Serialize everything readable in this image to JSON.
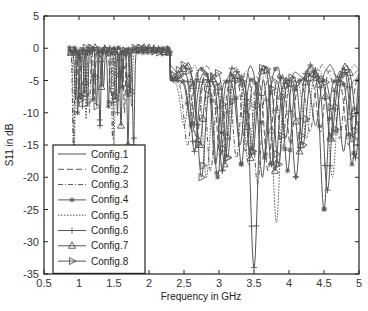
{
  "chart_data": {
    "type": "line",
    "title": "",
    "xlabel": "Frequency in GHz",
    "ylabel": "S11 in dB",
    "xlim": [
      0.5,
      5
    ],
    "ylim": [
      -35,
      5
    ],
    "xticks": [
      0.5,
      1,
      1.5,
      2,
      2.5,
      3,
      3.5,
      4,
      4.5,
      5
    ],
    "xtick_labels": [
      "0.5",
      "1",
      "1.5",
      "2",
      "2.5",
      "3",
      "3.5",
      "4",
      "4.5",
      "5"
    ],
    "yticks": [
      5,
      0,
      -5,
      -10,
      -15,
      -20,
      -25,
      -30,
      -35
    ],
    "ytick_labels": [
      "5",
      "0",
      "-5",
      "-10",
      "-15",
      "-20",
      "-25",
      "-30",
      "-35"
    ],
    "grid": false,
    "legend_position": "bottom-left",
    "line_color": "#555555",
    "series": [
      {
        "name": "Config.1",
        "style": "solid",
        "marker": "none",
        "dips": [
          [
            0.95,
            -8
          ],
          [
            1.12,
            -9
          ],
          [
            1.35,
            -6
          ],
          [
            1.58,
            -7
          ],
          [
            2.62,
            -13
          ],
          [
            2.95,
            -18
          ],
          [
            3.3,
            -15
          ],
          [
            3.62,
            -20
          ],
          [
            3.95,
            -14
          ],
          [
            4.38,
            -12
          ],
          [
            4.78,
            -16
          ]
        ]
      },
      {
        "name": "Config.2",
        "style": "dashed",
        "marker": "none",
        "dips": [
          [
            1.0,
            -9
          ],
          [
            1.22,
            -8
          ],
          [
            1.45,
            -7
          ],
          [
            1.65,
            -10
          ],
          [
            2.68,
            -14
          ],
          [
            3.02,
            -17
          ],
          [
            3.38,
            -16
          ],
          [
            3.7,
            -19
          ],
          [
            4.02,
            -15
          ],
          [
            4.45,
            -13
          ],
          [
            4.85,
            -15
          ]
        ]
      },
      {
        "name": "Config.3",
        "style": "dashdot",
        "marker": "none",
        "dips": [
          [
            0.92,
            -16
          ],
          [
            1.15,
            -10
          ],
          [
            1.48,
            -14
          ],
          [
            1.7,
            -8
          ],
          [
            2.55,
            -15
          ],
          [
            2.88,
            -19
          ],
          [
            3.25,
            -17
          ],
          [
            3.55,
            -21
          ],
          [
            3.9,
            -16
          ],
          [
            4.3,
            -13
          ],
          [
            4.72,
            -14
          ]
        ]
      },
      {
        "name": "Config.4",
        "style": "solid",
        "marker": "star",
        "dips": [
          [
            0.98,
            -10
          ],
          [
            1.2,
            -8
          ],
          [
            1.42,
            -9
          ],
          [
            1.62,
            -6
          ],
          [
            2.6,
            -12
          ],
          [
            2.98,
            -20
          ],
          [
            3.32,
            -18
          ],
          [
            3.65,
            -17
          ],
          [
            3.98,
            -19
          ],
          [
            4.5,
            -25
          ],
          [
            4.9,
            -18
          ]
        ]
      },
      {
        "name": "Config.5",
        "style": "dotted",
        "marker": "none",
        "dips": [
          [
            0.93,
            -17
          ],
          [
            1.1,
            -11
          ],
          [
            1.5,
            -15
          ],
          [
            1.75,
            -9
          ],
          [
            2.5,
            -12
          ],
          [
            2.82,
            -20
          ],
          [
            3.1,
            -16
          ],
          [
            3.42,
            -18
          ],
          [
            3.82,
            -27
          ],
          [
            4.25,
            -14
          ],
          [
            4.62,
            -20
          ]
        ]
      },
      {
        "name": "Config.6",
        "style": "solid",
        "marker": "plus",
        "dips": [
          [
            1.05,
            -9
          ],
          [
            1.3,
            -12
          ],
          [
            1.55,
            -10
          ],
          [
            1.78,
            -15
          ],
          [
            2.65,
            -16
          ],
          [
            3.05,
            -19
          ],
          [
            3.5,
            -34
          ],
          [
            3.75,
            -18
          ],
          [
            4.1,
            -20
          ],
          [
            4.55,
            -22
          ],
          [
            4.95,
            -17
          ]
        ]
      },
      {
        "name": "Config.7",
        "style": "solid",
        "marker": "triangle-up",
        "dips": [
          [
            1.08,
            -7
          ],
          [
            1.32,
            -6
          ],
          [
            1.6,
            -12
          ],
          [
            1.7,
            -15
          ],
          [
            2.72,
            -15
          ],
          [
            3.08,
            -18
          ],
          [
            3.45,
            -17
          ],
          [
            3.8,
            -19
          ],
          [
            4.15,
            -16
          ],
          [
            4.6,
            -14
          ],
          [
            4.98,
            -12
          ]
        ]
      },
      {
        "name": "Config.8",
        "style": "solid",
        "marker": "triangle-right",
        "dips": [
          [
            1.02,
            -8
          ],
          [
            1.25,
            -9
          ],
          [
            1.52,
            -8
          ],
          [
            1.73,
            -7
          ],
          [
            2.75,
            -20
          ],
          [
            3.12,
            -17
          ],
          [
            3.48,
            -16
          ],
          [
            3.85,
            -18
          ],
          [
            4.2,
            -15
          ],
          [
            4.65,
            -13
          ],
          [
            4.92,
            -14
          ]
        ]
      }
    ]
  }
}
